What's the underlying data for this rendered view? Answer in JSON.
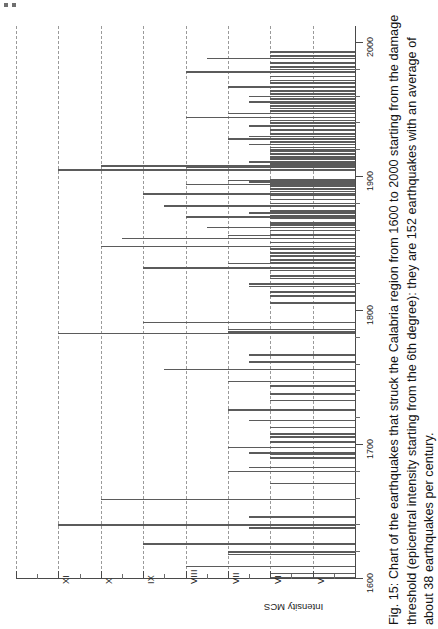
{
  "figure": {
    "caption": "Fig. 15: Chart of the earthquakes that struck the Calabria region from 1600 to 2000 starting from the damage threshold (epicentral intensity starting from the 6th degree): they are 152 earthquakes with an average of about 38 earthquakes per century.",
    "axis_title_intensity": "Intensity MCS",
    "intensity_tick_labels": [
      "XI",
      "X",
      "IX",
      "VIII",
      "VII",
      "VI",
      "V"
    ],
    "year_tick_labels": [
      "1600",
      "1700",
      "1800",
      "1900",
      "2000"
    ],
    "colors": {
      "bar": "#5b5b5b",
      "grid": "#9a9a9a",
      "axis": "#4a4a4a",
      "text": "#141414",
      "background": "#ffffff"
    }
  },
  "chart_data": {
    "type": "bar",
    "orientation": "horizontal",
    "title": "Chart of the earthquakes that struck the Calabria region from 1600 to 2000",
    "xlabel": "Intensity MCS",
    "ylabel": "Year",
    "xlim": [
      4,
      12
    ],
    "ylim": [
      1600,
      2000
    ],
    "grid": true,
    "legend": false,
    "x_ticks": [
      11,
      10,
      9,
      8,
      7,
      6,
      5
    ],
    "x_tick_labels": [
      "XI",
      "X",
      "IX",
      "VIII",
      "VII",
      "VI",
      "V"
    ],
    "y_ticks": [
      1600,
      1700,
      1800,
      1900,
      2000
    ],
    "y_tick_labels": [
      "1600",
      "1700",
      "1800",
      "1900",
      "2000"
    ],
    "total_earthquakes": 152,
    "average_per_century": 38,
    "damage_threshold_degree": 6,
    "series": [
      {
        "name": "Epicentral intensity (MCS)",
        "points": [
          {
            "year": 1601,
            "intensity": 6.0
          },
          {
            "year": 1604,
            "intensity": 6.0
          },
          {
            "year": 1609,
            "intensity": 8.0
          },
          {
            "year": 1618,
            "intensity": 7.0
          },
          {
            "year": 1620,
            "intensity": 7.0
          },
          {
            "year": 1626,
            "intensity": 9.0
          },
          {
            "year": 1638,
            "intensity": 6.5
          },
          {
            "year": 1640,
            "intensity": 11.0
          },
          {
            "year": 1646,
            "intensity": 6.5
          },
          {
            "year": 1659,
            "intensity": 10.0
          },
          {
            "year": 1671,
            "intensity": 6.0
          },
          {
            "year": 1680,
            "intensity": 7.0
          },
          {
            "year": 1683,
            "intensity": 6.5
          },
          {
            "year": 1690,
            "intensity": 6.0
          },
          {
            "year": 1693,
            "intensity": 6.0
          },
          {
            "year": 1694,
            "intensity": 6.5
          },
          {
            "year": 1698,
            "intensity": 7.0
          },
          {
            "year": 1702,
            "intensity": 6.0
          },
          {
            "year": 1706,
            "intensity": 6.0
          },
          {
            "year": 1708,
            "intensity": 6.0
          },
          {
            "year": 1713,
            "intensity": 6.0
          },
          {
            "year": 1718,
            "intensity": 6.5
          },
          {
            "year": 1726,
            "intensity": 7.0
          },
          {
            "year": 1733,
            "intensity": 6.0
          },
          {
            "year": 1738,
            "intensity": 6.0
          },
          {
            "year": 1744,
            "intensity": 6.0
          },
          {
            "year": 1747,
            "intensity": 7.0
          },
          {
            "year": 1756,
            "intensity": 8.5
          },
          {
            "year": 1762,
            "intensity": 6.5
          },
          {
            "year": 1767,
            "intensity": 6.5
          },
          {
            "year": 1783,
            "intensity": 11.0
          },
          {
            "year": 1784,
            "intensity": 7.0
          },
          {
            "year": 1786,
            "intensity": 7.0
          },
          {
            "year": 1791,
            "intensity": 9.0
          },
          {
            "year": 1806,
            "intensity": 6.0
          },
          {
            "year": 1811,
            "intensity": 6.0
          },
          {
            "year": 1814,
            "intensity": 6.0
          },
          {
            "year": 1818,
            "intensity": 6.5
          },
          {
            "year": 1820,
            "intensity": 6.5
          },
          {
            "year": 1824,
            "intensity": 6.0
          },
          {
            "year": 1826,
            "intensity": 6.0
          },
          {
            "year": 1830,
            "intensity": 6.0
          },
          {
            "year": 1832,
            "intensity": 9.0
          },
          {
            "year": 1835,
            "intensity": 7.0
          },
          {
            "year": 1836,
            "intensity": 6.0
          },
          {
            "year": 1838,
            "intensity": 6.0
          },
          {
            "year": 1841,
            "intensity": 6.0
          },
          {
            "year": 1843,
            "intensity": 6.0
          },
          {
            "year": 1846,
            "intensity": 6.0
          },
          {
            "year": 1848,
            "intensity": 10.0
          },
          {
            "year": 1851,
            "intensity": 6.0
          },
          {
            "year": 1854,
            "intensity": 9.5
          },
          {
            "year": 1856,
            "intensity": 7.0
          },
          {
            "year": 1857,
            "intensity": 6.0
          },
          {
            "year": 1860,
            "intensity": 6.0
          },
          {
            "year": 1862,
            "intensity": 7.5
          },
          {
            "year": 1864,
            "intensity": 6.0
          },
          {
            "year": 1865,
            "intensity": 6.0
          },
          {
            "year": 1866,
            "intensity": 6.0
          },
          {
            "year": 1869,
            "intensity": 6.0
          },
          {
            "year": 1870,
            "intensity": 8.0
          },
          {
            "year": 1871,
            "intensity": 6.0
          },
          {
            "year": 1873,
            "intensity": 6.5
          },
          {
            "year": 1874,
            "intensity": 6.0
          },
          {
            "year": 1875,
            "intensity": 6.0
          },
          {
            "year": 1878,
            "intensity": 8.5
          },
          {
            "year": 1880,
            "intensity": 6.0
          },
          {
            "year": 1883,
            "intensity": 6.0
          },
          {
            "year": 1886,
            "intensity": 6.0
          },
          {
            "year": 1887,
            "intensity": 9.0
          },
          {
            "year": 1889,
            "intensity": 6.0
          },
          {
            "year": 1891,
            "intensity": 6.0
          },
          {
            "year": 1893,
            "intensity": 6.0
          },
          {
            "year": 1894,
            "intensity": 8.0
          },
          {
            "year": 1895,
            "intensity": 6.0
          },
          {
            "year": 1896,
            "intensity": 6.5
          },
          {
            "year": 1897,
            "intensity": 7.0
          },
          {
            "year": 1898,
            "intensity": 6.0
          },
          {
            "year": 1905,
            "intensity": 11.0
          },
          {
            "year": 1907,
            "intensity": 8.0
          },
          {
            "year": 1908,
            "intensity": 10.0
          },
          {
            "year": 1909,
            "intensity": 6.0
          },
          {
            "year": 1910,
            "intensity": 6.0
          },
          {
            "year": 1911,
            "intensity": 6.5
          },
          {
            "year": 1913,
            "intensity": 6.0
          },
          {
            "year": 1914,
            "intensity": 6.0
          },
          {
            "year": 1915,
            "intensity": 6.0
          },
          {
            "year": 1917,
            "intensity": 6.0
          },
          {
            "year": 1919,
            "intensity": 6.0
          },
          {
            "year": 1920,
            "intensity": 6.0
          },
          {
            "year": 1922,
            "intensity": 6.0
          },
          {
            "year": 1924,
            "intensity": 6.5
          },
          {
            "year": 1926,
            "intensity": 6.0
          },
          {
            "year": 1928,
            "intensity": 7.0
          },
          {
            "year": 1930,
            "intensity": 6.5
          },
          {
            "year": 1932,
            "intensity": 6.0
          },
          {
            "year": 1935,
            "intensity": 6.0
          },
          {
            "year": 1938,
            "intensity": 6.5
          },
          {
            "year": 1940,
            "intensity": 6.0
          },
          {
            "year": 1942,
            "intensity": 6.0
          },
          {
            "year": 1944,
            "intensity": 8.0
          },
          {
            "year": 1947,
            "intensity": 7.0
          },
          {
            "year": 1949,
            "intensity": 6.0
          },
          {
            "year": 1951,
            "intensity": 6.0
          },
          {
            "year": 1953,
            "intensity": 6.0
          },
          {
            "year": 1955,
            "intensity": 6.0
          },
          {
            "year": 1956,
            "intensity": 6.5
          },
          {
            "year": 1958,
            "intensity": 6.0
          },
          {
            "year": 1960,
            "intensity": 6.5
          },
          {
            "year": 1962,
            "intensity": 6.0
          },
          {
            "year": 1964,
            "intensity": 6.0
          },
          {
            "year": 1967,
            "intensity": 7.0
          },
          {
            "year": 1970,
            "intensity": 6.0
          },
          {
            "year": 1972,
            "intensity": 6.0
          },
          {
            "year": 1975,
            "intensity": 6.0
          },
          {
            "year": 1978,
            "intensity": 8.0
          },
          {
            "year": 1980,
            "intensity": 6.0
          },
          {
            "year": 1982,
            "intensity": 6.0
          },
          {
            "year": 1985,
            "intensity": 6.0
          },
          {
            "year": 1988,
            "intensity": 7.5
          },
          {
            "year": 1990,
            "intensity": 6.0
          },
          {
            "year": 1993,
            "intensity": 6.0
          }
        ]
      }
    ]
  }
}
